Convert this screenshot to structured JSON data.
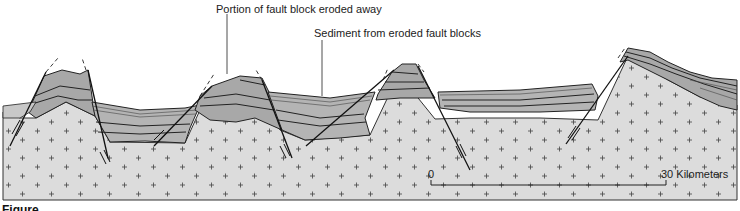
{
  "diagram": {
    "labels": {
      "eroded_portion": "Portion of fault block eroded away",
      "sediment": "Sediment from eroded fault blocks"
    },
    "scale_bar": {
      "start_label": "0",
      "end_label": "30 Kilometers"
    },
    "figure_caption_fragment": "Figure",
    "colors": {
      "bedrock": "#dcdcdc",
      "rock_layer": "#a8a8a8",
      "rock_layer_dark": "#9a9a9a",
      "sediment": "#b4b4b4",
      "line": "#222222",
      "background": "#ffffff"
    },
    "blocks": [
      {
        "name": "horst-1",
        "type": "uplifted fault block"
      },
      {
        "name": "graben-1",
        "type": "down-dropped basin"
      },
      {
        "name": "horst-2",
        "type": "uplifted fault block"
      },
      {
        "name": "graben-2",
        "type": "down-dropped basin"
      },
      {
        "name": "horst-3",
        "type": "uplifted fault block"
      },
      {
        "name": "graben-3",
        "type": "down-dropped basin"
      },
      {
        "name": "tilted-block",
        "type": "tilted fault block"
      }
    ]
  }
}
